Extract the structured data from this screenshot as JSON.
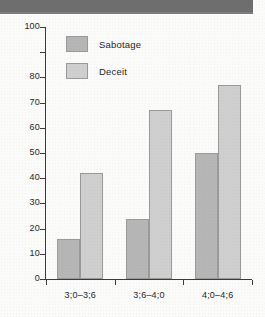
{
  "header": {
    "band_color": "#6e6e6e"
  },
  "chart_data": {
    "type": "bar",
    "title": "",
    "subtitle": "",
    "xlabel": "",
    "ylabel": "",
    "categories": [
      "3;0–3;6",
      "3;6–4;0",
      "4;0–4;6"
    ],
    "series": [
      {
        "name": "Sabotage",
        "color": "#b6b6b6",
        "values": [
          16,
          24,
          50
        ]
      },
      {
        "name": "Deceit",
        "color": "#cfcfcf",
        "values": [
          42,
          67,
          77
        ]
      }
    ],
    "ylim": [
      0,
      100
    ],
    "ytick_values": [
      100,
      80,
      70,
      60,
      50,
      40,
      30,
      20,
      10,
      0
    ],
    "ytick_labels": [
      "100",
      "80",
      "70",
      "60",
      "50",
      "40",
      "30",
      "20",
      "10",
      "0"
    ],
    "ytick_positions": [
      100,
      90,
      80,
      70,
      60,
      50,
      40,
      30,
      20,
      10,
      0
    ],
    "grid": false,
    "legend_position": "top-left",
    "legend_entries": [
      "Sabotage",
      "Deceit"
    ]
  }
}
